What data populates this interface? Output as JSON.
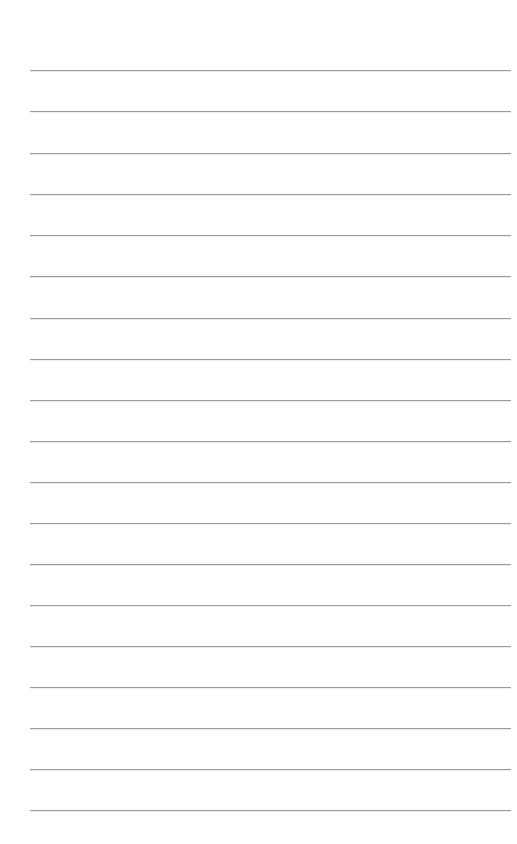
{
  "page": {
    "type": "lined-notebook-page",
    "background_color": "#ffffff",
    "line_color": "#9a9a9a",
    "line_count": 19,
    "line_left_px": 30,
    "line_right_px": 511,
    "line_positions_y": [
      70,
      111,
      153,
      194,
      235,
      276,
      318,
      359,
      400,
      441,
      482,
      523,
      564,
      605,
      646,
      687,
      728,
      769,
      810
    ],
    "lines": [
      {
        "text": ""
      },
      {
        "text": ""
      },
      {
        "text": ""
      },
      {
        "text": ""
      },
      {
        "text": ""
      },
      {
        "text": ""
      },
      {
        "text": ""
      },
      {
        "text": ""
      },
      {
        "text": ""
      },
      {
        "text": ""
      },
      {
        "text": ""
      },
      {
        "text": ""
      },
      {
        "text": ""
      },
      {
        "text": ""
      },
      {
        "text": ""
      },
      {
        "text": ""
      },
      {
        "text": ""
      },
      {
        "text": ""
      },
      {
        "text": ""
      }
    ]
  }
}
